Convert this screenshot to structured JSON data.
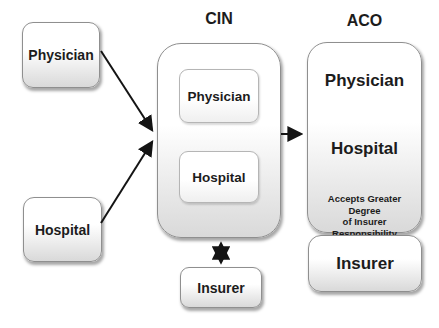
{
  "diagram": {
    "title_cin": "CIN",
    "title_aco": "ACO",
    "standalone": {
      "physician": "Physician",
      "hospital": "Hospital"
    },
    "cin": {
      "physician": "Physician",
      "hospital": "Hospital",
      "insurer": "Insurer"
    },
    "aco": {
      "physician": "Physician",
      "hospital": "Hospital",
      "note_lines": [
        "Accepts Greater Degree",
        "of Insurer",
        "Responsibility"
      ],
      "insurer": "Insurer"
    },
    "colors": {
      "background": "#ffffff",
      "box_border": "#8f8f8f",
      "box_fill_top": "#ffffff",
      "box_fill_bottom": "#d9d9d9",
      "text": "#1c1c1c",
      "arrow": "#141414"
    }
  }
}
